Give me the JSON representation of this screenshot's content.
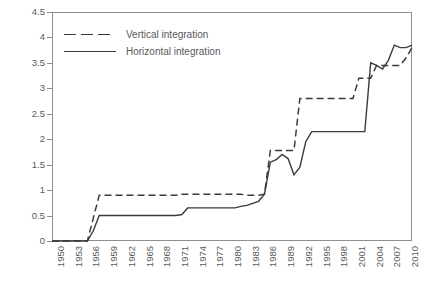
{
  "chart_data": {
    "type": "line",
    "title": "",
    "xlabel": "",
    "ylabel": "",
    "xlim": [
      1950,
      2011
    ],
    "ylim": [
      0,
      4.5
    ],
    "grid": false,
    "legend_position": "top-left",
    "y_ticks": [
      "0",
      "0.5",
      "1",
      "1.5",
      "2",
      "2.5",
      "3",
      "3.5",
      "4",
      "4.5"
    ],
    "y_tick_values": [
      0,
      0.5,
      1,
      1.5,
      2,
      2.5,
      3,
      3.5,
      4,
      4.5
    ],
    "x_ticks": [
      "1950",
      "1953",
      "1956",
      "1959",
      "1962",
      "1965",
      "1968",
      "1971",
      "1974",
      "1977",
      "1980",
      "1983",
      "1986",
      "1989",
      "1992",
      "1995",
      "1998",
      "2001",
      "2004",
      "2007",
      "2010"
    ],
    "x_tick_values": [
      1950,
      1953,
      1956,
      1959,
      1962,
      1965,
      1968,
      1971,
      1974,
      1977,
      1980,
      1983,
      1986,
      1989,
      1992,
      1995,
      1998,
      2001,
      2004,
      2007,
      2010
    ],
    "series": [
      {
        "name": "Vertical integration",
        "style": "dashed",
        "color": "#3b3b3d",
        "x": [
          1950,
          1956,
          1957,
          1958,
          1971,
          1972,
          1982,
          1983,
          1985,
          1986,
          1987,
          1988,
          1990,
          1991,
          1992,
          1993,
          2000,
          2001,
          2002,
          2003,
          2004,
          2005,
          2006,
          2007,
          2008,
          2009,
          2010,
          2011
        ],
        "values": [
          0,
          0,
          0.45,
          0.9,
          0.9,
          0.92,
          0.92,
          0.9,
          0.9,
          0.92,
          1.78,
          1.78,
          1.78,
          1.78,
          2.8,
          2.8,
          2.8,
          2.8,
          3.2,
          3.2,
          3.2,
          3.45,
          3.45,
          3.45,
          3.45,
          3.45,
          3.6,
          3.8
        ]
      },
      {
        "name": "Horizontal integration",
        "style": "solid",
        "color": "#3b3b3d",
        "x": [
          1950,
          1956,
          1957,
          1958,
          1971,
          1972,
          1973,
          1981,
          1982,
          1983,
          1985,
          1986,
          1987,
          1988,
          1989,
          1990,
          1991,
          1992,
          1993,
          1994,
          1995,
          2003,
          2004,
          2005,
          2006,
          2007,
          2008,
          2009,
          2010,
          2011
        ],
        "values": [
          0,
          0,
          0.2,
          0.5,
          0.5,
          0.52,
          0.65,
          0.65,
          0.68,
          0.7,
          0.78,
          0.92,
          1.55,
          1.6,
          1.7,
          1.62,
          1.3,
          1.45,
          1.95,
          2.15,
          2.15,
          2.15,
          3.5,
          3.45,
          3.38,
          3.55,
          3.85,
          3.8,
          3.8,
          3.85
        ]
      }
    ]
  },
  "legend": {
    "items": [
      {
        "label": "Vertical integration",
        "style": "dashed"
      },
      {
        "label": "Horizontal integration",
        "style": "solid"
      }
    ]
  }
}
